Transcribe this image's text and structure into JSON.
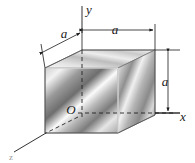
{
  "figure": {
    "background_color": "#ffffff",
    "line_color": "#1a1a1a",
    "edge_color": "#555555",
    "axes": [
      {
        "name": "y-axis",
        "label": "y",
        "direction": "up",
        "label_x": 89,
        "label_y": 14
      },
      {
        "name": "x-axis",
        "label": "x",
        "direction": "right",
        "label_x": 183,
        "label_y": 120
      },
      {
        "name": "z-axis",
        "label": "z",
        "direction": "down-left",
        "label_x": 11,
        "label_y": 159
      }
    ],
    "origin": {
      "label": "O",
      "x": 72,
      "y": 110
    },
    "dimensions": [
      {
        "name": "depth-dimension",
        "label": "a",
        "label_x": 65,
        "label_y": 38,
        "orientation": "diagonal"
      },
      {
        "name": "width-dimension",
        "label": "a",
        "label_x": 114,
        "label_y": 35,
        "orientation": "horizontal"
      },
      {
        "name": "height-dimension",
        "label": "a",
        "label_x": 168,
        "label_y": 84,
        "orientation": "vertical"
      }
    ],
    "cube": {
      "name": "shaded-cube",
      "face_front_fill": "metallic-gradient-front",
      "face_top_fill": "metallic-gradient-top",
      "face_right_fill": "metallic-gradient-right",
      "hidden_edges": "dashed"
    }
  }
}
